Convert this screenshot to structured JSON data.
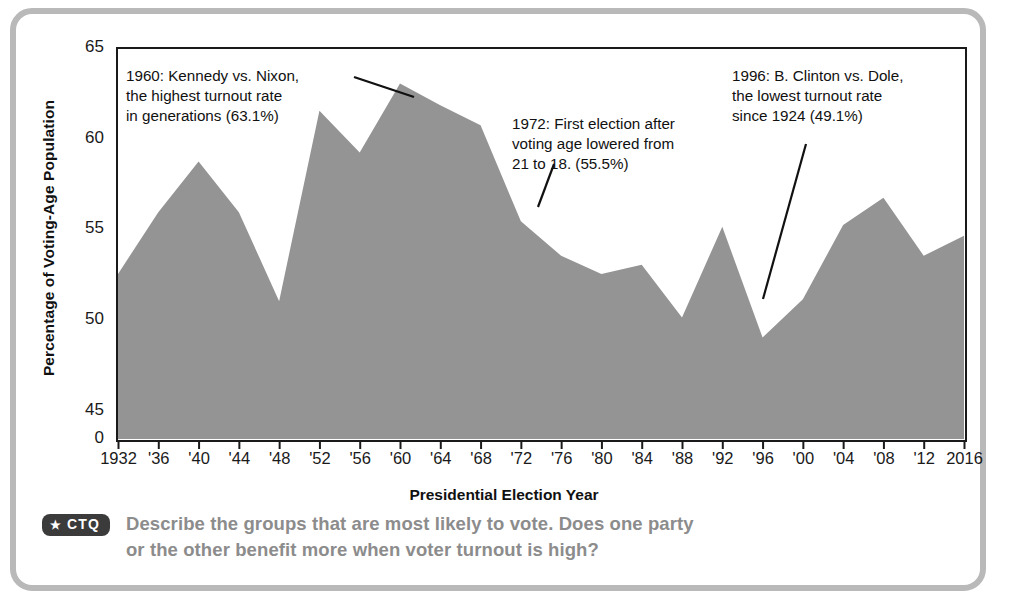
{
  "figure": {
    "border_color": "#b9b9b9",
    "area_fill": "#949494"
  },
  "axes": {
    "y_title": "Percentage of Voting-Age Population",
    "x_title": "Presidential Election Year",
    "y_ticks": [
      "65",
      "60",
      "55",
      "50",
      "45",
      "0"
    ],
    "x_ticks": [
      "1932",
      "'36",
      "'40",
      "'44",
      "'48",
      "'52",
      "'56",
      "'60",
      "'64",
      "'68",
      "'72",
      "'76",
      "'80",
      "'84",
      "'88",
      "'92",
      "'96",
      "'00",
      "'04",
      "'08",
      "'12",
      "2016"
    ]
  },
  "annotations": {
    "a1960": "1960: Kennedy vs. Nixon,\nthe highest turnout rate\nin generations (63.1%)",
    "a1972": "1972: First election after\nvoting age lowered from\n21 to 18. (55.5%)",
    "a1996": "1996: B. Clinton vs. Dole,\nthe lowest turnout rate\nsince 1924 (49.1%)"
  },
  "ctq": {
    "badge_star": "★",
    "badge_label": "CTQ",
    "question": "Describe the groups that are most likely to vote. Does one party\nor the other benefit more when voter turnout is high?"
  },
  "chart_data": {
    "type": "area",
    "title": "",
    "xlabel": "Presidential Election Year",
    "ylabel": "Percentage of Voting-Age Population",
    "ylim": [
      43.5,
      65
    ],
    "y_axis_broken_at_zero": true,
    "grid": false,
    "legend": "none",
    "categories": [
      1932,
      1936,
      1940,
      1944,
      1948,
      1952,
      1956,
      1960,
      1964,
      1968,
      1972,
      1976,
      1980,
      1984,
      1988,
      1992,
      1996,
      2000,
      2004,
      2008,
      2012,
      2016
    ],
    "values": [
      52.6,
      56.0,
      58.8,
      56.0,
      51.1,
      61.6,
      59.3,
      63.1,
      61.9,
      60.8,
      55.5,
      53.6,
      52.6,
      53.1,
      50.2,
      55.2,
      49.1,
      51.2,
      55.3,
      56.8,
      53.6,
      54.7
    ],
    "series": [
      {
        "name": "Voter turnout",
        "values": [
          52.6,
          56.0,
          58.8,
          56.0,
          51.1,
          61.6,
          59.3,
          63.1,
          61.9,
          60.8,
          55.5,
          53.6,
          52.6,
          53.1,
          50.2,
          55.2,
          49.1,
          51.2,
          55.3,
          56.8,
          53.6,
          54.7
        ]
      }
    ],
    "annotations": [
      {
        "year": 1960,
        "value": 63.1,
        "text": "1960: Kennedy vs. Nixon, the highest turnout rate in generations (63.1%)"
      },
      {
        "year": 1972,
        "value": 55.5,
        "text": "1972: First election after voting age lowered from 21 to 18. (55.5%)"
      },
      {
        "year": 1996,
        "value": 49.1,
        "text": "1996: B. Clinton vs. Dole, the lowest turnout rate since 1924 (49.1%)"
      }
    ]
  }
}
